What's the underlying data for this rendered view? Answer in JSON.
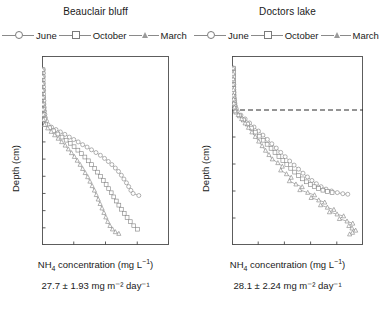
{
  "figure": {
    "background": "#ffffff",
    "axis_color": "#4d4d4d",
    "series_color": "#8a8a8a"
  },
  "legend": {
    "items": [
      {
        "label": "June",
        "marker": "circle-marker"
      },
      {
        "label": "October",
        "marker": "square-marker"
      },
      {
        "label": "March",
        "marker": "triangle-marker"
      }
    ]
  },
  "panels": [
    {
      "id": "beauclair-bluff",
      "title": "Beauclair bluff",
      "flux": "27.7 ± 1.93 mg m⁻² day⁻¹",
      "flux_value": 27.7,
      "flux_error": 1.93,
      "flux_units": "mg m-2 day-1"
    },
    {
      "id": "doctors-lake",
      "title": "Doctors lake",
      "flux": "28.1 ± 2.24 mg m⁻² day⁻¹",
      "flux_value": 28.1,
      "flux_error": 2.24,
      "flux_units": "mg m-2 day-1"
    }
  ],
  "axis_labels": {
    "y": "Depth (cm)",
    "x_prefix": "NH",
    "x_sub": "4",
    "x_mid": " concentration (mg L",
    "x_sup": "−1",
    "x_suffix": ")"
  },
  "chart_data": [
    {
      "type": "line",
      "id": "beauclair-bluff",
      "title": "Beauclair bluff",
      "xlabel": "NH4 concentration (mg L-1)",
      "ylabel": "Depth (cm)",
      "xlim": [
        0,
        40
      ],
      "ylim": [
        -20,
        35
      ],
      "y_inverted": true,
      "xticks": [
        0,
        10,
        20,
        30,
        40
      ],
      "yticks": [
        -20,
        -15,
        -10,
        -5,
        0,
        5,
        10,
        15,
        20,
        25,
        30,
        35
      ],
      "grid": false,
      "legend_position": "above-plot",
      "zero_line": false,
      "series": [
        {
          "name": "June",
          "marker": "circle",
          "points": [
            [
              0.4,
              -16.0
            ],
            [
              0.4,
              -15.0
            ],
            [
              0.4,
              -14.0
            ],
            [
              0.4,
              -13.0
            ],
            [
              0.4,
              -12.0
            ],
            [
              0.5,
              -11.0
            ],
            [
              0.5,
              -10.0
            ],
            [
              0.5,
              -9.0
            ],
            [
              0.5,
              -8.0
            ],
            [
              0.6,
              -7.0
            ],
            [
              0.6,
              -6.0
            ],
            [
              0.7,
              -5.0
            ],
            [
              0.8,
              -4.0
            ],
            [
              0.9,
              -3.0
            ],
            [
              1.1,
              -2.0
            ],
            [
              1.4,
              -1.0
            ],
            [
              1.9,
              0.0
            ],
            [
              3.0,
              0.7
            ],
            [
              4.4,
              1.4
            ],
            [
              5.8,
              2.1
            ],
            [
              7.2,
              2.8
            ],
            [
              8.6,
              3.6
            ],
            [
              10.0,
              4.3
            ],
            [
              11.4,
              5.0
            ],
            [
              12.8,
              5.8
            ],
            [
              14.2,
              6.5
            ],
            [
              15.6,
              7.3
            ],
            [
              17.0,
              8.1
            ],
            [
              18.4,
              8.9
            ],
            [
              19.7,
              9.8
            ],
            [
              20.9,
              10.7
            ],
            [
              22.0,
              11.6
            ],
            [
              23.1,
              12.6
            ],
            [
              24.1,
              13.6
            ],
            [
              25.0,
              14.7
            ],
            [
              25.8,
              15.8
            ],
            [
              26.6,
              16.9
            ],
            [
              27.3,
              18.0
            ],
            [
              28.0,
              19.1
            ],
            [
              28.7,
              20.0
            ],
            [
              30.5,
              20.6
            ]
          ]
        },
        {
          "name": "October",
          "marker": "square",
          "points": [
            [
              0.3,
              -16.0
            ],
            [
              0.3,
              -14.0
            ],
            [
              0.3,
              -12.0
            ],
            [
              0.3,
              -10.0
            ],
            [
              0.4,
              -8.0
            ],
            [
              0.4,
              -6.0
            ],
            [
              0.5,
              -4.5
            ],
            [
              0.6,
              -3.0
            ],
            [
              0.8,
              -1.5
            ],
            [
              1.2,
              0.0
            ],
            [
              2.4,
              0.9
            ],
            [
              3.7,
              1.8
            ],
            [
              5.0,
              2.7
            ],
            [
              6.3,
              3.6
            ],
            [
              7.6,
              4.5
            ],
            [
              8.9,
              5.4
            ],
            [
              10.1,
              6.4
            ],
            [
              11.3,
              7.4
            ],
            [
              12.4,
              8.4
            ],
            [
              13.5,
              9.4
            ],
            [
              14.6,
              10.5
            ],
            [
              15.6,
              11.6
            ],
            [
              16.6,
              12.7
            ],
            [
              17.5,
              13.8
            ],
            [
              18.4,
              15.0
            ],
            [
              19.3,
              16.2
            ],
            [
              20.2,
              17.4
            ],
            [
              21.0,
              18.6
            ],
            [
              21.8,
              19.8
            ],
            [
              22.6,
              21.0
            ],
            [
              23.4,
              22.2
            ],
            [
              24.2,
              23.4
            ],
            [
              25.0,
              24.6
            ],
            [
              25.9,
              25.8
            ],
            [
              26.8,
              27.0
            ],
            [
              27.8,
              28.2
            ],
            [
              28.9,
              29.4
            ],
            [
              30.1,
              30.4
            ]
          ]
        },
        {
          "name": "March",
          "marker": "triangle",
          "points": [
            [
              0.2,
              -16.0
            ],
            [
              0.2,
              -14.0
            ],
            [
              0.2,
              -12.0
            ],
            [
              0.2,
              -10.0
            ],
            [
              0.3,
              -8.0
            ],
            [
              0.3,
              -6.0
            ],
            [
              0.3,
              -4.5
            ],
            [
              0.4,
              -3.0
            ],
            [
              0.5,
              -1.5
            ],
            [
              0.8,
              0.0
            ],
            [
              1.8,
              1.0
            ],
            [
              2.9,
              2.0
            ],
            [
              4.0,
              3.0
            ],
            [
              5.1,
              4.0
            ],
            [
              6.2,
              5.0
            ],
            [
              7.3,
              6.0
            ],
            [
              8.3,
              7.1
            ],
            [
              9.3,
              8.2
            ],
            [
              10.2,
              9.3
            ],
            [
              11.1,
              10.4
            ],
            [
              12.0,
              11.6
            ],
            [
              12.8,
              12.8
            ],
            [
              13.6,
              14.0
            ],
            [
              14.4,
              15.2
            ],
            [
              15.1,
              16.5
            ],
            [
              15.8,
              17.8
            ],
            [
              16.5,
              19.1
            ],
            [
              17.1,
              20.4
            ],
            [
              17.7,
              21.7
            ],
            [
              18.3,
              23.0
            ],
            [
              18.9,
              24.3
            ],
            [
              19.5,
              25.6
            ],
            [
              20.1,
              26.9
            ],
            [
              20.7,
              28.2
            ],
            [
              21.4,
              29.4
            ],
            [
              22.2,
              30.4
            ],
            [
              23.1,
              31.2
            ],
            [
              24.2,
              31.7
            ]
          ]
        }
      ]
    },
    {
      "type": "line",
      "id": "doctors-lake",
      "title": "Doctors lake",
      "xlabel": "NH4 concentration (mg L-1)",
      "ylabel": "Depth (cm)",
      "xlim": [
        0,
        50
      ],
      "ylim": [
        -20,
        50
      ],
      "y_inverted": true,
      "xticks": [
        0,
        10,
        20,
        30,
        40,
        50
      ],
      "yticks": [
        -20,
        -10,
        0,
        10,
        20,
        30,
        40,
        50
      ],
      "grid": false,
      "legend_position": "above-plot",
      "zero_line": true,
      "zero_line_style": "dashed",
      "series": [
        {
          "name": "June",
          "marker": "circle",
          "points": [
            [
              0.6,
              -15.5
            ],
            [
              0.6,
              -14.5
            ],
            [
              0.6,
              -13.5
            ],
            [
              0.6,
              -12.5
            ],
            [
              0.6,
              -11.5
            ],
            [
              0.6,
              -10.5
            ],
            [
              0.7,
              -9.5
            ],
            [
              0.7,
              -8.5
            ],
            [
              0.7,
              -7.5
            ],
            [
              0.8,
              -6.5
            ],
            [
              0.8,
              -5.5
            ],
            [
              0.9,
              -4.5
            ],
            [
              1.0,
              -3.5
            ],
            [
              1.1,
              -2.5
            ],
            [
              1.3,
              -1.5
            ],
            [
              1.6,
              -0.5
            ],
            [
              2.0,
              0.5
            ],
            [
              3.4,
              1.9
            ],
            [
              5.0,
              3.3
            ],
            [
              6.7,
              4.8
            ],
            [
              8.4,
              6.3
            ],
            [
              10.1,
              7.8
            ],
            [
              11.8,
              9.3
            ],
            [
              13.5,
              10.9
            ],
            [
              15.2,
              12.5
            ],
            [
              16.9,
              14.1
            ],
            [
              18.6,
              15.7
            ],
            [
              20.3,
              17.3
            ],
            [
              22.0,
              18.9
            ],
            [
              23.7,
              20.4
            ],
            [
              25.4,
              21.9
            ],
            [
              27.1,
              23.4
            ],
            [
              28.8,
              24.8
            ],
            [
              30.5,
              26.1
            ],
            [
              32.2,
              27.3
            ],
            [
              34.0,
              28.4
            ],
            [
              35.9,
              29.3
            ],
            [
              38.0,
              30.0
            ],
            [
              40.2,
              30.6
            ],
            [
              42.3,
              31.0
            ],
            [
              44.2,
              31.2
            ]
          ]
        },
        {
          "name": "October",
          "marker": "square",
          "points": [
            [
              0.5,
              -15.5
            ],
            [
              0.5,
              -14.0
            ],
            [
              0.5,
              -12.5
            ],
            [
              0.5,
              -11.0
            ],
            [
              0.5,
              -9.5
            ],
            [
              0.6,
              -8.0
            ],
            [
              0.6,
              -6.5
            ],
            [
              0.7,
              -5.0
            ],
            [
              0.8,
              -3.5
            ],
            [
              0.9,
              -2.0
            ],
            [
              1.1,
              -0.5
            ],
            [
              1.5,
              0.8
            ],
            [
              2.9,
              2.2
            ],
            [
              4.4,
              3.7
            ],
            [
              5.9,
              5.2
            ],
            [
              7.4,
              6.7
            ],
            [
              8.9,
              8.2
            ],
            [
              10.4,
              9.7
            ],
            [
              11.9,
              11.2
            ],
            [
              13.4,
              12.7
            ],
            [
              14.9,
              14.2
            ],
            [
              16.4,
              15.7
            ],
            [
              17.9,
              17.2
            ],
            [
              19.4,
              18.7
            ],
            [
              20.9,
              20.2
            ],
            [
              22.4,
              21.6
            ],
            [
              23.9,
              23.0
            ],
            [
              25.4,
              24.3
            ],
            [
              26.9,
              25.5
            ],
            [
              28.4,
              26.6
            ],
            [
              29.9,
              27.6
            ],
            [
              31.4,
              28.4
            ],
            [
              33.0,
              29.1
            ],
            [
              34.7,
              29.7
            ],
            [
              36.4,
              30.2
            ],
            [
              38.2,
              30.6
            ]
          ]
        },
        {
          "name": "March",
          "marker": "triangle",
          "points": [
            [
              0.4,
              -15.5
            ],
            [
              0.4,
              -13.5
            ],
            [
              0.4,
              -11.5
            ],
            [
              0.4,
              -9.5
            ],
            [
              0.5,
              -7.5
            ],
            [
              0.5,
              -5.5
            ],
            [
              0.6,
              -4.0
            ],
            [
              0.7,
              -2.5
            ],
            [
              0.9,
              -1.0
            ],
            [
              1.2,
              0.4
            ],
            [
              2.4,
              1.8
            ],
            [
              3.7,
              3.3
            ],
            [
              5.0,
              4.9
            ],
            [
              6.3,
              6.5
            ],
            [
              7.6,
              8.2
            ],
            [
              8.9,
              9.9
            ],
            [
              10.2,
              11.6
            ],
            [
              11.5,
              13.3
            ],
            [
              12.8,
              15.0
            ],
            [
              14.1,
              16.6
            ],
            [
              15.4,
              18.2
            ],
            [
              17.5,
              19.6
            ],
            [
              19.2,
              20.9
            ],
            [
              18.6,
              22.3
            ],
            [
              20.8,
              23.7
            ],
            [
              22.6,
              25.0
            ],
            [
              21.9,
              26.3
            ],
            [
              24.4,
              27.5
            ],
            [
              26.8,
              28.5
            ],
            [
              25.9,
              29.6
            ],
            [
              28.9,
              30.6
            ],
            [
              31.5,
              31.5
            ],
            [
              30.2,
              32.5
            ],
            [
              33.1,
              33.4
            ],
            [
              35.4,
              34.2
            ],
            [
              33.8,
              35.2
            ],
            [
              36.4,
              36.1
            ],
            [
              38.9,
              36.9
            ],
            [
              37.2,
              37.8
            ],
            [
              40.1,
              38.6
            ],
            [
              42.6,
              39.3
            ],
            [
              41.0,
              40.3
            ],
            [
              43.9,
              41.2
            ],
            [
              46.1,
              42.0
            ],
            [
              44.6,
              42.9
            ],
            [
              45.8,
              43.8
            ],
            [
              47.2,
              44.6
            ],
            [
              46.0,
              45.4
            ],
            [
              44.9,
              46.0
            ]
          ]
        }
      ]
    }
  ]
}
